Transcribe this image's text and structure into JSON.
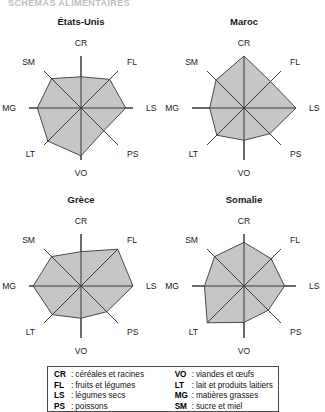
{
  "figure": {
    "top_caption": "SCHEMAS ALIMENTAIRES"
  },
  "legend": {
    "left_column": [
      {
        "abbr": "CR",
        "sep": ":",
        "text": "céréales et racines"
      },
      {
        "abbr": "FL",
        "sep": ":",
        "text": "fruits et légumes"
      },
      {
        "abbr": "LS",
        "sep": ":",
        "text": "légumes secs"
      },
      {
        "abbr": "PS",
        "sep": ":",
        "text": "poissons"
      }
    ],
    "right_column": [
      {
        "abbr": "VO",
        "sep": ":",
        "text": "viandes et œufs"
      },
      {
        "abbr": "LT",
        "sep": ":",
        "text": "lait et produits laitiers"
      },
      {
        "abbr": "MG",
        "sep": ":",
        "text": "matières grasses"
      },
      {
        "abbr": "SM",
        "sep": ":",
        "text": "sucre et miel"
      }
    ]
  },
  "chart_data": [
    {
      "type": "radar",
      "title": "États-Unis",
      "categories": [
        "CR",
        "FL",
        "LS",
        "PS",
        "VO",
        "LT",
        "MG",
        "SM"
      ],
      "values": [
        0.6,
        0.78,
        0.86,
        0.62,
        0.92,
        0.9,
        0.84,
        0.8
      ],
      "rlim": [
        0,
        1
      ],
      "grid": false,
      "axis_labels": [
        "CR",
        "FL",
        "LS",
        "PS",
        "VO",
        "LT",
        "MG",
        "SM"
      ]
    },
    {
      "type": "radar",
      "title": "Maroc",
      "categories": [
        "CR",
        "FL",
        "LS",
        "PS",
        "VO",
        "LT",
        "MG",
        "SM"
      ],
      "values": [
        1.0,
        0.72,
        1.0,
        0.7,
        0.62,
        0.74,
        0.66,
        0.76
      ],
      "rlim": [
        0,
        1
      ],
      "grid": false,
      "axis_labels": [
        "CR",
        "FL",
        "LS",
        "PS",
        "VO",
        "LT",
        "MG",
        "SM"
      ]
    },
    {
      "type": "radar",
      "title": "Grèce",
      "categories": [
        "CR",
        "FL",
        "LS",
        "PS",
        "VO",
        "LT",
        "MG",
        "SM"
      ],
      "values": [
        0.66,
        1.0,
        1.0,
        0.7,
        0.62,
        0.78,
        0.92,
        0.8
      ],
      "rlim": [
        0,
        1
      ],
      "grid": false,
      "axis_labels": [
        "CR",
        "FL",
        "LS",
        "PS",
        "VO",
        "LT",
        "MG",
        "SM"
      ]
    },
    {
      "type": "radar",
      "title": "Somalie",
      "categories": [
        "CR",
        "FL",
        "LS",
        "PS",
        "VO",
        "LT",
        "MG",
        "SM"
      ],
      "values": [
        0.84,
        0.74,
        0.78,
        0.66,
        0.7,
        1.0,
        0.76,
        0.8
      ],
      "rlim": [
        0,
        1
      ],
      "grid": false,
      "axis_labels": [
        "CR",
        "FL",
        "LS",
        "PS",
        "VO",
        "LT",
        "MG",
        "SM"
      ]
    }
  ],
  "style": {
    "fill_color": "#c6c6c6",
    "stroke_color": "#4a4a4a",
    "axis_color": "#3a3a3a",
    "text_color": "#1a1a1a"
  }
}
